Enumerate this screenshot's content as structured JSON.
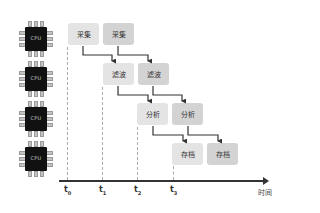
{
  "diagram": {
    "type": "pipeline-timing",
    "processors": [
      {
        "label": "CPU"
      },
      {
        "label": "CPU"
      },
      {
        "label": "CPU"
      },
      {
        "label": "CPU"
      }
    ],
    "stages": [
      {
        "name": "采集",
        "boxes": [
          "采集",
          "采集"
        ]
      },
      {
        "name": "滤波",
        "boxes": [
          "滤波",
          "滤波"
        ]
      },
      {
        "name": "分析",
        "boxes": [
          "分析",
          "分析"
        ]
      },
      {
        "name": "存档",
        "boxes": [
          "存档",
          "存档"
        ]
      }
    ],
    "time_axis": {
      "label": "时间",
      "ticks": [
        {
          "base": "t",
          "sub": "0"
        },
        {
          "base": "t",
          "sub": "1"
        },
        {
          "base": "t",
          "sub": "2"
        },
        {
          "base": "t",
          "sub": "3"
        }
      ]
    },
    "colors": {
      "box_light": "#e4e4e4",
      "box_dark": "#d3d3d3",
      "chip": "#111111",
      "axis": "#333333",
      "arrow": "#333333"
    }
  }
}
